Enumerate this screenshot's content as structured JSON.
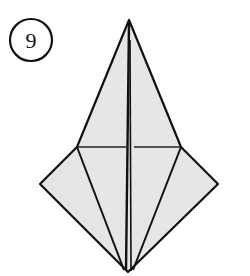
{
  "step": {
    "number": "9"
  },
  "diagram": {
    "fill_color": "#e6e6e6",
    "line_color": "#111111"
  }
}
